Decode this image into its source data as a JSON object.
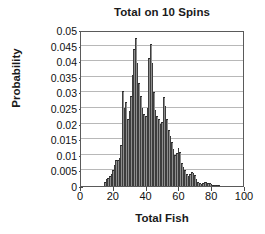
{
  "chart_data": {
    "type": "bar",
    "title": "Total on 10 Spins",
    "xlabel": "Total Fish",
    "ylabel": "Probability",
    "xlim": [
      0,
      100
    ],
    "ylim": [
      0,
      0.05
    ],
    "grid": true,
    "legend": null,
    "xticks": [
      "0",
      "20",
      "40",
      "60",
      "80",
      "100"
    ],
    "xtick_values": [
      0,
      20,
      40,
      60,
      80,
      100
    ],
    "yticks": [
      "0",
      "0.005",
      "0.01",
      "0.015",
      "0.02",
      "0.025",
      "0.03",
      "0.035",
      "0.04",
      "0.045",
      "0.05"
    ],
    "ytick_values": [
      0,
      0.005,
      0.01,
      0.015,
      0.02,
      0.025,
      0.03,
      0.035,
      0.04,
      0.045,
      0.05
    ],
    "bar_color": "#8e8e8e",
    "bar_edge_color": "#333333",
    "x": [
      14,
      15,
      16,
      17,
      18,
      19,
      20,
      21,
      22,
      23,
      24,
      25,
      26,
      27,
      28,
      29,
      30,
      31,
      32,
      33,
      34,
      35,
      36,
      37,
      38,
      39,
      40,
      41,
      42,
      43,
      44,
      45,
      46,
      47,
      48,
      49,
      50,
      51,
      52,
      53,
      54,
      55,
      56,
      57,
      58,
      59,
      60,
      61,
      62,
      63,
      64,
      65,
      66,
      67,
      68,
      69,
      70,
      71,
      72,
      73,
      74,
      75,
      76,
      77,
      78,
      79,
      80,
      81,
      82,
      83,
      84
    ],
    "values": [
      0.0012,
      0.0022,
      0.0026,
      0.0032,
      0.004,
      0.005,
      0.0068,
      0.0082,
      0.0084,
      0.009,
      0.013,
      0.0305,
      0.025,
      0.027,
      0.0215,
      0.024,
      0.029,
      0.0355,
      0.044,
      0.0475,
      0.0395,
      0.033,
      0.029,
      0.025,
      0.023,
      0.0225,
      0.025,
      0.041,
      0.0455,
      0.0395,
      0.03,
      0.0245,
      0.0225,
      0.0215,
      0.02,
      0.0205,
      0.0285,
      0.0255,
      0.0215,
      0.018,
      0.016,
      0.014,
      0.012,
      0.01,
      0.0105,
      0.0122,
      0.011,
      0.0075,
      0.0062,
      0.005,
      0.004,
      0.0032,
      0.004,
      0.0046,
      0.0042,
      0.0034,
      0.0022,
      0.0014,
      0.0009,
      0.0008,
      0.001,
      0.0012,
      0.0012,
      0.0011,
      0.0009,
      0.0007,
      0.0004,
      0.0003,
      0.0002,
      0.0001,
      0.0001
    ]
  }
}
